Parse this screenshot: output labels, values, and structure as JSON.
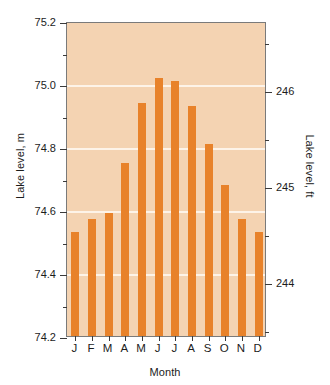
{
  "chart_data": {
    "type": "bar",
    "title": "",
    "xlabel": "Month",
    "ylabel": "Lake level, m",
    "ylabel_secondary": "Lake level, ft",
    "categories": [
      "J",
      "F",
      "M",
      "A",
      "M",
      "J",
      "J",
      "A",
      "S",
      "O",
      "N",
      "D"
    ],
    "category_names": [
      "January",
      "February",
      "March",
      "April",
      "May",
      "June",
      "July",
      "August",
      "September",
      "October",
      "November",
      "December"
    ],
    "values": [
      74.53,
      74.57,
      74.59,
      74.75,
      74.94,
      75.02,
      75.01,
      74.93,
      74.81,
      74.68,
      74.57,
      74.53
    ],
    "values_ft": [
      244.52,
      244.65,
      244.72,
      245.24,
      245.87,
      246.13,
      246.1,
      245.83,
      245.44,
      245.01,
      244.65,
      244.52
    ],
    "ylim": [
      74.2,
      75.2
    ],
    "ylim_secondary": [
      243.44,
      246.72
    ],
    "ytick_labels": [
      "75.2",
      "75.0",
      "74.8",
      "74.6",
      "74.4",
      "74.2"
    ],
    "ytick_values": [
      75.2,
      75.0,
      74.8,
      74.6,
      74.4,
      74.2
    ],
    "yminor_values": [
      75.1,
      74.9,
      74.7,
      74.5,
      74.3
    ],
    "ytick_labels_secondary": [
      "246",
      "245",
      "244"
    ],
    "ytick_values_secondary": [
      246,
      245,
      244
    ],
    "yminor_values_secondary": [
      246.5,
      245.5,
      244.5,
      243.5
    ],
    "gridlines_at": [
      75.0,
      74.8,
      74.6,
      74.4
    ],
    "grid": true,
    "legend": "none",
    "bar_color": "#e8822a",
    "plot_background": "#f4d3b2",
    "gridline_color": "#fdf3e8",
    "axis_color": "#7a7a7a",
    "text_color": "#1c1c1c"
  }
}
